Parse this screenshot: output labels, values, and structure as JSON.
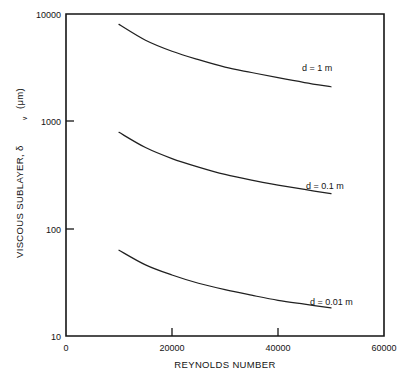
{
  "chart_data": {
    "type": "line",
    "title": "",
    "xlabel": "REYNOLDS NUMBER",
    "ylabel": "VISCOUS SUBLAYER,  δ",
    "ylabel_sub": "v",
    "ylabel_units": "(μm)",
    "xlim": [
      0,
      60000
    ],
    "ylim": [
      10,
      10000
    ],
    "yscale": "log",
    "xscale": "linear",
    "grid": false,
    "legend_position": "inline-annotations",
    "xticks": [
      0,
      20000,
      40000,
      60000
    ],
    "xtick_labels": [
      "0",
      "20000",
      "40000",
      "60000"
    ],
    "yticks": [
      10,
      100,
      1000,
      10000
    ],
    "ytick_labels": [
      "10",
      "100",
      "1000",
      "10000"
    ],
    "x": [
      10000,
      15000,
      20000,
      25000,
      30000,
      35000,
      40000,
      45000,
      50000
    ],
    "series": [
      {
        "name": "d = 1 m",
        "label": "d = 1 m",
        "values": [
          8000,
          5700,
          4500,
          3750,
          3200,
          2850,
          2550,
          2300,
          2100
        ]
      },
      {
        "name": "d = 0.1 m",
        "label": "d = 0.1 m",
        "values": [
          790,
          570,
          450,
          375,
          320,
          283,
          255,
          232,
          212
        ]
      },
      {
        "name": "d = 0.01 m",
        "label": "d = 0.01 m",
        "values": [
          63,
          46,
          37,
          31,
          27,
          24,
          21.5,
          19.8,
          18.3
        ]
      }
    ],
    "annotations": [
      {
        "text": "d = 1 m",
        "x_px": 302,
        "y_px": 71
      },
      {
        "text": "d = 0.1 m",
        "x_px": 306,
        "y_px": 189
      },
      {
        "text": "d = 0.01 m",
        "x_px": 310,
        "y_px": 305
      }
    ]
  }
}
